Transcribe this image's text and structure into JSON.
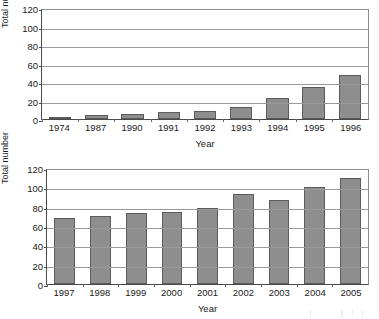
{
  "figure": {
    "axis_color": "#4a4a4a",
    "grid_color": "#9a9a9a",
    "bar_fill": "#8e8e8e",
    "bar_border": "#5b5b5b"
  },
  "chart_data": [
    {
      "type": "bar",
      "title": "",
      "xlabel": "Year",
      "ylabel": "Total number",
      "categories": [
        "1974",
        "1987",
        "1990",
        "1991",
        "1992",
        "1993",
        "1994",
        "1995",
        "1996"
      ],
      "values": [
        2,
        4,
        5,
        8,
        9,
        13,
        23,
        35,
        48
      ],
      "ylim": [
        0,
        120
      ],
      "yticks": [
        0,
        20,
        40,
        60,
        80,
        100,
        120
      ],
      "ytick_labels": [
        "0",
        "20",
        "40",
        "60",
        "80",
        "100",
        "120"
      ],
      "grid": true,
      "grid_axis": "y",
      "legend": false
    },
    {
      "type": "bar",
      "title": "",
      "xlabel": "Year",
      "ylabel": "Total number",
      "categories": [
        "1997",
        "1998",
        "1999",
        "2000",
        "2001",
        "2002",
        "2003",
        "2004",
        "2005"
      ],
      "values": [
        68,
        70,
        73,
        75,
        79,
        93,
        87,
        100,
        110
      ],
      "ylim": [
        0,
        120
      ],
      "yticks": [
        0,
        20,
        40,
        60,
        80,
        100,
        120
      ],
      "ytick_labels": [
        "0",
        "20",
        "40",
        "60",
        "80",
        "100",
        "120"
      ],
      "grid": true,
      "grid_axis": "y",
      "legend": false
    }
  ]
}
